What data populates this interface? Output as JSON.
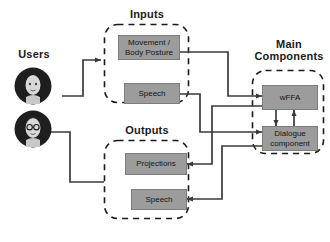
{
  "diagram": {
    "title_users": "Users",
    "groups": {
      "inputs": {
        "label": "Inputs"
      },
      "outputs": {
        "label": "Outputs"
      },
      "main": {
        "label_line1": "Main",
        "label_line2": "Components"
      }
    },
    "nodes": {
      "movement": {
        "line1": "Movement /",
        "line2": "Body Posture"
      },
      "speech_in": {
        "line1": "Speech"
      },
      "projections": {
        "line1": "Projections"
      },
      "speech_out": {
        "line1": "Speech"
      },
      "wffa": {
        "line1": "wFFA"
      },
      "dialogue": {
        "line1": "Dialogue",
        "line2": "component"
      }
    },
    "avatars": [
      {
        "name": "user-avatar-top",
        "glasses": "no"
      },
      {
        "name": "user-avatar-bottom",
        "glasses": "yes"
      }
    ],
    "colors": {
      "node_fill": "#9c9c9c",
      "node_stroke": "#7d7d7d",
      "connector": "#3a3a3a",
      "group_dash": "#1a1a1a",
      "text": "#141414",
      "background": "#ffffff"
    }
  }
}
